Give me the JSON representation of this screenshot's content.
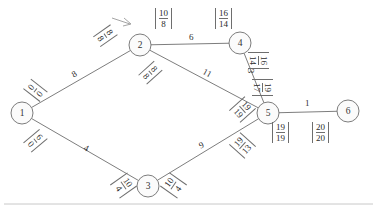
{
  "figure": {
    "type": "network-diagram"
  },
  "nodes": [
    {
      "id": "1",
      "label": "1",
      "cx": 22,
      "cy": 113
    },
    {
      "id": "2",
      "label": "2",
      "cx": 140,
      "cy": 45
    },
    {
      "id": "3",
      "label": "3",
      "cx": 148,
      "cy": 186
    },
    {
      "id": "4",
      "label": "4",
      "cx": 240,
      "cy": 43
    },
    {
      "id": "5",
      "label": "5",
      "cx": 268,
      "cy": 113
    },
    {
      "id": "6",
      "label": "6",
      "cx": 348,
      "cy": 111
    }
  ],
  "edges": [
    {
      "from": "1",
      "to": "2",
      "weight": "8"
    },
    {
      "from": "1",
      "to": "3",
      "weight": "4"
    },
    {
      "from": "2",
      "to": "4",
      "weight": "6"
    },
    {
      "from": "2",
      "to": "5",
      "weight": "11"
    },
    {
      "from": "3",
      "to": "5",
      "weight": "9"
    },
    {
      "from": "4",
      "to": "5",
      "weight": "3"
    },
    {
      "from": "5",
      "to": "6",
      "weight": "1"
    }
  ],
  "annotations": [
    {
      "name": "node-1-upper",
      "top": "0",
      "bottom": "0",
      "x": 29,
      "y": 80,
      "rot": -52
    },
    {
      "name": "node-1-lower",
      "top": "6",
      "bottom": "0",
      "x": 29,
      "y": 130,
      "rot": 50
    },
    {
      "name": "node-2-incoming",
      "top": "8",
      "bottom": "8",
      "x": 99,
      "y": 25,
      "rot": 55
    },
    {
      "name": "node-2-top",
      "top": "10",
      "bottom": "8",
      "x": 155,
      "y": 8,
      "rot": 0
    },
    {
      "name": "node-2-lower",
      "top": "8",
      "bottom": "8",
      "x": 144,
      "y": 62,
      "rot": 48
    },
    {
      "name": "node-4-top",
      "top": "16",
      "bottom": "14",
      "x": 215,
      "y": 8,
      "rot": 0
    },
    {
      "name": "edge-4-5-upper",
      "top": "16",
      "bottom": "14",
      "x": 250,
      "y": 50,
      "rot": 90
    },
    {
      "name": "edge-4-5-lower",
      "top": "19",
      "bottom": "17",
      "x": 254,
      "y": 77,
      "rot": 90
    },
    {
      "name": "edge-2-5-near-5",
      "top": "19",
      "bottom": "19",
      "x": 234,
      "y": 99,
      "rot": 48
    },
    {
      "name": "edge-3-5-near-5",
      "top": "19",
      "bottom": "13",
      "x": 234,
      "y": 135,
      "rot": -48
    },
    {
      "name": "node-3-left",
      "top": "10",
      "bottom": "4",
      "x": 115,
      "y": 175,
      "rot": 55
    },
    {
      "name": "node-3-right",
      "top": "10",
      "bottom": "4",
      "x": 165,
      "y": 175,
      "rot": -55
    },
    {
      "name": "node-5-bottom",
      "top": "19",
      "bottom": "19",
      "x": 272,
      "y": 122,
      "rot": 0
    },
    {
      "name": "node-6-bottom",
      "top": "20",
      "bottom": "20",
      "x": 312,
      "y": 122,
      "rot": 0
    }
  ],
  "edge_label_positions": [
    {
      "edge": "1-2",
      "weight": "8",
      "x": 72,
      "y": 69,
      "rot": -30
    },
    {
      "edge": "1-3",
      "weight": "4",
      "x": 84,
      "y": 143,
      "rot": 26
    },
    {
      "edge": "2-4",
      "weight": "6",
      "x": 189,
      "y": 32,
      "rot": 0
    },
    {
      "edge": "2-5",
      "weight": "11",
      "x": 203,
      "y": 68,
      "rot": 28
    },
    {
      "edge": "3-5",
      "weight": "9",
      "x": 199,
      "y": 140,
      "rot": -24
    },
    {
      "edge": "4-5",
      "weight": "3",
      "x": 249,
      "y": 66,
      "rot": 90
    },
    {
      "edge": "5-6",
      "weight": "1",
      "x": 305,
      "y": 98,
      "rot": 0
    }
  ],
  "colors": {
    "stroke": "#6e6e6e",
    "text": "#2b2b2b",
    "node_fill": "#fbfbfb",
    "divider": "#c8c8c8"
  }
}
